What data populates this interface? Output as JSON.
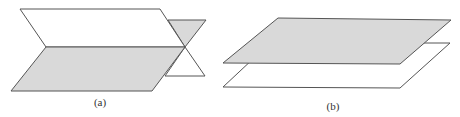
{
  "figure": {
    "colors": {
      "fill_gray": "#d9d9d9",
      "fill_white": "#ffffff",
      "stroke": "#555555"
    },
    "panels": [
      {
        "id": "a",
        "label": "(a)",
        "description": "Two intersecting planes"
      },
      {
        "id": "b",
        "label": "(b)",
        "description": "Two parallel planes"
      }
    ]
  }
}
